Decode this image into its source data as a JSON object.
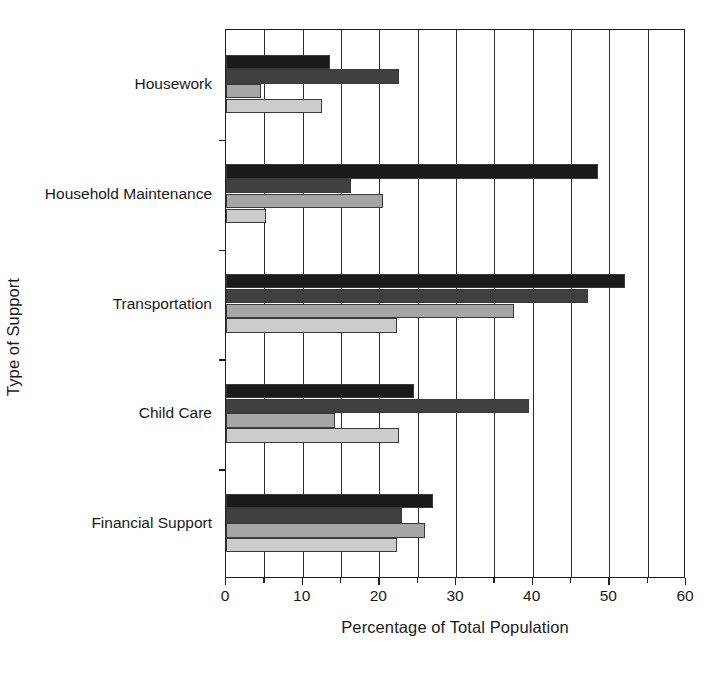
{
  "chart_data": {
    "type": "bar",
    "orientation": "horizontal",
    "title": "",
    "xlabel": "Percentage of Total Population",
    "ylabel": "Type of Support",
    "categories": [
      "Housework",
      "Household Maintenance",
      "Transportation",
      "Child Care",
      "Financial Support"
    ],
    "xlim": [
      0,
      60
    ],
    "xticks": [
      0,
      10,
      20,
      30,
      40,
      50,
      60
    ],
    "xtick_labels": [
      "0",
      "10",
      "20",
      "30",
      "40",
      "50",
      "60"
    ],
    "minor_gridlines_at": [
      5,
      15,
      25,
      35,
      45,
      55
    ],
    "grid": "vertical",
    "legend": "none",
    "series": [
      {
        "name": "series-1",
        "color": "#1a1a1a",
        "values": [
          13.5,
          48.5,
          52.0,
          24.5,
          27.0
        ]
      },
      {
        "name": "series-2",
        "color": "#404040",
        "values": [
          22.5,
          16.3,
          47.2,
          39.5,
          23.0
        ]
      },
      {
        "name": "series-3",
        "color": "#a6a6a6",
        "values": [
          4.5,
          20.5,
          37.5,
          14.2,
          26.0
        ]
      },
      {
        "name": "series-4",
        "color": "#cccccc",
        "values": [
          12.5,
          5.2,
          22.3,
          22.5,
          22.3
        ]
      }
    ]
  },
  "axis": {
    "x_title": "Percentage of Total Population",
    "y_title": "Type of Support"
  }
}
